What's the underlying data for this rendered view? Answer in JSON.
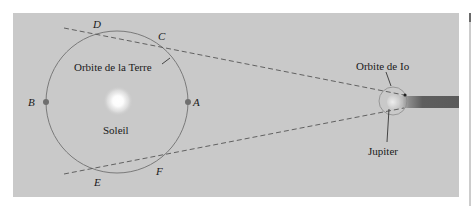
{
  "diagram": {
    "background_color": "#c9c9c9",
    "page_color": "#ffffff",
    "labels": {
      "earth_orbit": "Orbite de la Terre",
      "sun": "Soleil",
      "io_orbit": "Orbite de Io",
      "jupiter": "Jupiter"
    },
    "points": [
      {
        "id": "A",
        "label": "A"
      },
      {
        "id": "B",
        "label": "B"
      },
      {
        "id": "C",
        "label": "C"
      },
      {
        "id": "D",
        "label": "D"
      },
      {
        "id": "E",
        "label": "E"
      },
      {
        "id": "F",
        "label": "F"
      }
    ],
    "colors": {
      "orbit": "#7a7a7a",
      "dashed_line": "#555555",
      "shadow": "#5a5a5a",
      "sun_glow": "#ffffff",
      "text": "#1a1a1a"
    }
  }
}
